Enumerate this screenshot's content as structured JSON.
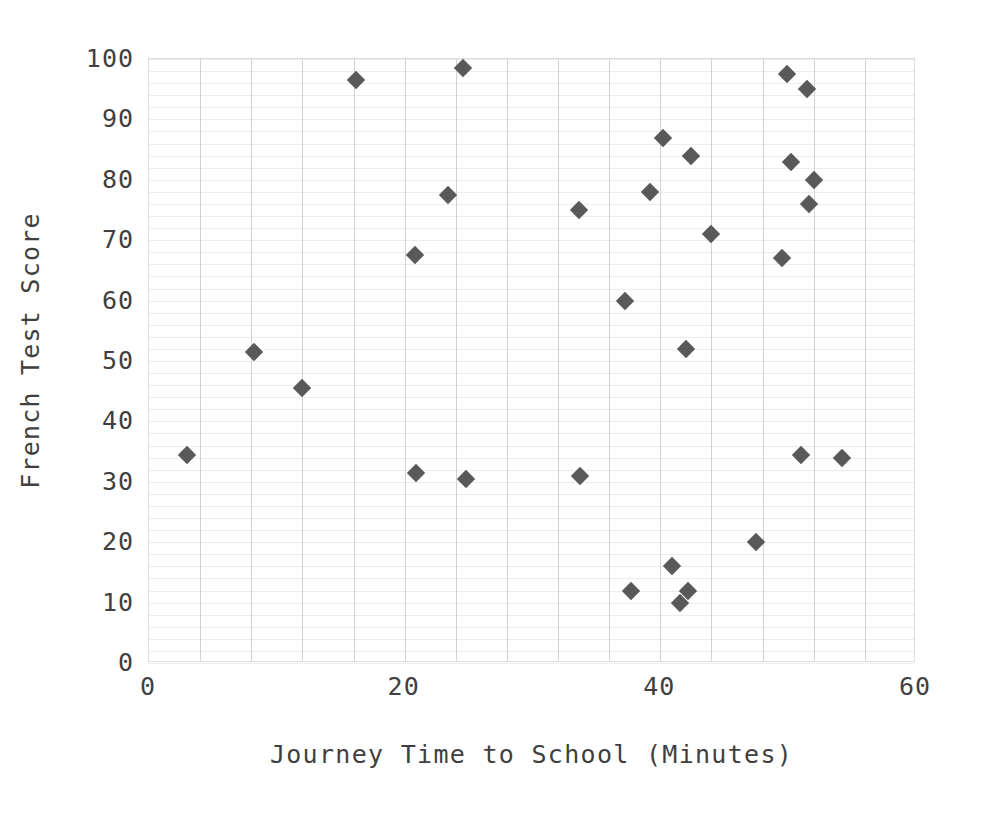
{
  "chart_data": {
    "type": "scatter",
    "title": "",
    "xlabel": "Journey Time to School (Minutes)",
    "ylabel": "French Test Score",
    "xlim": [
      0,
      60
    ],
    "ylim": [
      0,
      100
    ],
    "xticks": [
      0,
      20,
      40,
      60
    ],
    "yticks": [
      0,
      10,
      20,
      30,
      40,
      50,
      60,
      70,
      80,
      90,
      100
    ],
    "xtick_labels": [
      "0",
      "20",
      "40",
      "60"
    ],
    "ytick_labels": [
      "0",
      "10",
      "20",
      "30",
      "40",
      "50",
      "60",
      "70",
      "80",
      "90",
      "100"
    ],
    "grid": {
      "horizontal_minor_step": 2,
      "vertical_major_step": 4,
      "horizontal_color": "#ececec",
      "vertical_color": "#d2d2d2"
    },
    "legend": null,
    "marker": {
      "shape": "diamond",
      "color": "#595959",
      "size_px": 13
    },
    "series": [
      {
        "name": "French Test Score vs Journey Time",
        "points": [
          {
            "x": 3.0,
            "y": 34.5
          },
          {
            "x": 8.2,
            "y": 51.5
          },
          {
            "x": 12.0,
            "y": 45.5
          },
          {
            "x": 16.2,
            "y": 96.5
          },
          {
            "x": 20.8,
            "y": 67.5
          },
          {
            "x": 20.9,
            "y": 31.5
          },
          {
            "x": 23.4,
            "y": 77.5
          },
          {
            "x": 24.6,
            "y": 98.5
          },
          {
            "x": 24.8,
            "y": 30.5
          },
          {
            "x": 33.6,
            "y": 75.0
          },
          {
            "x": 33.7,
            "y": 31.0
          },
          {
            "x": 37.2,
            "y": 60.0
          },
          {
            "x": 37.7,
            "y": 12.0
          },
          {
            "x": 39.2,
            "y": 78.0
          },
          {
            "x": 40.2,
            "y": 87.0
          },
          {
            "x": 40.9,
            "y": 16.0
          },
          {
            "x": 41.5,
            "y": 10.0
          },
          {
            "x": 42.0,
            "y": 52.0
          },
          {
            "x": 42.2,
            "y": 12.0
          },
          {
            "x": 42.4,
            "y": 84.0
          },
          {
            "x": 44.0,
            "y": 71.0
          },
          {
            "x": 47.5,
            "y": 20.0
          },
          {
            "x": 49.5,
            "y": 67.0
          },
          {
            "x": 49.9,
            "y": 97.5
          },
          {
            "x": 50.2,
            "y": 83.0
          },
          {
            "x": 51.0,
            "y": 34.5
          },
          {
            "x": 51.5,
            "y": 95.0
          },
          {
            "x": 51.6,
            "y": 76.0
          },
          {
            "x": 52.0,
            "y": 80.0
          },
          {
            "x": 54.2,
            "y": 34.0
          }
        ]
      }
    ]
  }
}
